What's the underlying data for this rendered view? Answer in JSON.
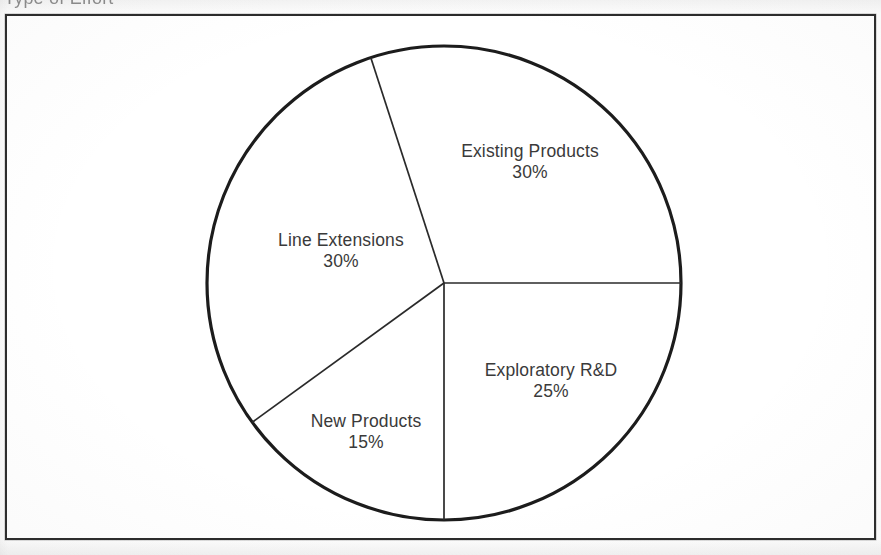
{
  "document": {
    "caption": "Type of Effort",
    "frame_border_color": "#2b2b2b",
    "page_background": "#fdfdfd",
    "ink_color": "#1c1c1c",
    "text_color": "#3a3a3a"
  },
  "chart_data": {
    "type": "pie",
    "title": "Type of Effort",
    "xlabel": "",
    "ylabel": "",
    "legend_position": "none",
    "grid": false,
    "units": "percent",
    "total": 100,
    "start_angle_deg": 0,
    "direction": "clockwise",
    "categories": [
      "Exploratory R&D",
      "New Products",
      "Line Extensions",
      "Existing Products"
    ],
    "values": [
      25,
      15,
      30,
      30
    ],
    "labels": [
      "25%",
      "15%",
      "30%",
      "30%"
    ],
    "slices": [
      {
        "name": "Exploratory R&D",
        "value": 25,
        "label": "25%",
        "start_deg": 0,
        "end_deg": 90,
        "label_x": 551,
        "label_y": 381
      },
      {
        "name": "New Products",
        "value": 15,
        "label": "15%",
        "start_deg": 90,
        "end_deg": 144,
        "label_x": 366,
        "label_y": 432
      },
      {
        "name": "Line Extensions",
        "value": 30,
        "label": "30%",
        "start_deg": 144,
        "end_deg": 252,
        "label_x": 341,
        "label_y": 251
      },
      {
        "name": "Existing Products",
        "value": 30,
        "label": "30%",
        "start_deg": 252,
        "end_deg": 360,
        "label_x": 530,
        "label_y": 162
      }
    ],
    "geometry": {
      "center_x": 444,
      "center_y": 283,
      "radius": 237
    }
  }
}
